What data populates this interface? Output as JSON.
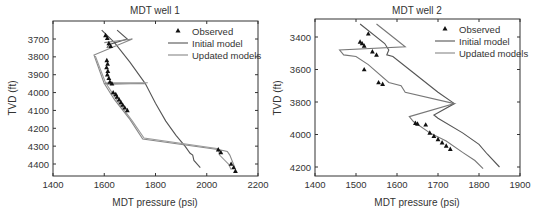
{
  "chart_data": [
    {
      "type": "line",
      "title": "MDT well 1",
      "xlabel": "MDT pressure (psi)",
      "ylabel": "TVD (ft)",
      "xlim": [
        1400,
        2200
      ],
      "ylim": [
        3620,
        4460
      ],
      "y_inverted": true,
      "xticks": [
        1400,
        1600,
        1800,
        2000,
        2200
      ],
      "yticks": [
        3700,
        3800,
        3900,
        4000,
        4100,
        4200,
        4300,
        4400
      ],
      "grid": false,
      "legend": {
        "position": "upper right",
        "entries": [
          "Observed",
          "Initial model",
          "Updated models"
        ]
      },
      "series": [
        {
          "name": "Observed",
          "kind": "scatter",
          "marker": "triangle",
          "points": [
            [
              1605,
              3680
            ],
            [
              1612,
              3695
            ],
            [
              1618,
              3725
            ],
            [
              1625,
              3740
            ],
            [
              1610,
              3820
            ],
            [
              1613,
              3840
            ],
            [
              1609,
              3860
            ],
            [
              1614,
              3880
            ],
            [
              1612,
              3900
            ],
            [
              1618,
              3920
            ],
            [
              1622,
              3940
            ],
            [
              1630,
              3950
            ],
            [
              1635,
              4000
            ],
            [
              1645,
              4010
            ],
            [
              1650,
              4025
            ],
            [
              1658,
              4040
            ],
            [
              1665,
              4055
            ],
            [
              1672,
              4070
            ],
            [
              1680,
              4085
            ],
            [
              1690,
              4100
            ],
            [
              2045,
              4320
            ],
            [
              2055,
              4335
            ],
            [
              2095,
              4400
            ],
            [
              2105,
              4420
            ],
            [
              2112,
              4440
            ]
          ]
        },
        {
          "name": "Initial model",
          "kind": "line",
          "color": "#555555",
          "points": [
            [
              1590,
              3650
            ],
            [
              1640,
              3720
            ],
            [
              1700,
              3830
            ],
            [
              1760,
              3950
            ],
            [
              1800,
              4060
            ],
            [
              1840,
              4160
            ],
            [
              1880,
              4240
            ],
            [
              1915,
              4300
            ],
            [
              1935,
              4340
            ],
            [
              1945,
              4350
            ],
            [
              1950,
              4380
            ],
            [
              1975,
              4420
            ]
          ]
        },
        {
          "name": "Initial model (branch)",
          "kind": "line",
          "color": "#555555",
          "points": [
            [
              1650,
              3650
            ],
            [
              1690,
              3700
            ],
            [
              1620,
              3730
            ],
            [
              1610,
              3750
            ]
          ]
        },
        {
          "name": "Updated models A",
          "kind": "line",
          "color": "#888888",
          "points": [
            [
              1600,
              3720
            ],
            [
              1710,
              3700
            ],
            [
              1560,
              3790
            ],
            [
              1600,
              3950
            ],
            [
              1760,
              3950
            ],
            [
              1600,
              3950
            ],
            [
              1640,
              4040
            ],
            [
              1700,
              4150
            ],
            [
              1750,
              4260
            ],
            [
              2050,
              4320
            ],
            [
              2080,
              4330
            ],
            [
              2090,
              4350
            ],
            [
              2110,
              4420
            ]
          ]
        },
        {
          "name": "Updated models B",
          "kind": "line",
          "color": "#999999",
          "points": [
            [
              1565,
              3795
            ],
            [
              1605,
              3945
            ],
            [
              1770,
              3945
            ],
            [
              1610,
              3955
            ],
            [
              1650,
              4045
            ],
            [
              1710,
              4160
            ],
            [
              1755,
              4255
            ],
            [
              2045,
              4315
            ],
            [
              2050,
              4350
            ],
            [
              2085,
              4400
            ],
            [
              2095,
              4430
            ]
          ]
        }
      ]
    },
    {
      "type": "line",
      "title": "MDT well 2",
      "xlabel": "MDT pressure (psi)",
      "ylabel": "TVD (ft)",
      "xlim": [
        1400,
        1900
      ],
      "ylim": [
        3290,
        4260
      ],
      "y_inverted": true,
      "xticks": [
        1400,
        1500,
        1600,
        1700,
        1800,
        1900
      ],
      "yticks": [
        3400,
        3600,
        3800,
        4000,
        4200
      ],
      "grid": false,
      "legend": {
        "position": "upper right",
        "entries": [
          "Observed",
          "Initial model",
          "Updated models"
        ]
      },
      "series": [
        {
          "name": "Observed",
          "kind": "scatter",
          "marker": "triangle",
          "points": [
            [
              1530,
              3380
            ],
            [
              1510,
              3430
            ],
            [
              1515,
              3440
            ],
            [
              1520,
              3455
            ],
            [
              1540,
              3490
            ],
            [
              1550,
              3510
            ],
            [
              1520,
              3600
            ],
            [
              1555,
              3680
            ],
            [
              1565,
              3690
            ],
            [
              1645,
              3930
            ],
            [
              1650,
              3935
            ],
            [
              1670,
              3940
            ],
            [
              1680,
              3990
            ],
            [
              1690,
              4010
            ],
            [
              1700,
              4030
            ],
            [
              1710,
              4050
            ],
            [
              1720,
              4070
            ],
            [
              1730,
              4090
            ]
          ]
        },
        {
          "name": "Initial model",
          "kind": "line",
          "color": "#555555",
          "points": [
            [
              1510,
              3320
            ],
            [
              1570,
              3440
            ],
            [
              1580,
              3480
            ],
            [
              1575,
              3510
            ],
            [
              1590,
              3520
            ],
            [
              1640,
              3620
            ],
            [
              1700,
              3740
            ],
            [
              1740,
              3810
            ],
            [
              1690,
              3880
            ],
            [
              1700,
              3900
            ],
            [
              1760,
              3990
            ],
            [
              1800,
              4060
            ],
            [
              1820,
              4120
            ],
            [
              1850,
              4200
            ]
          ]
        },
        {
          "name": "Updated models",
          "kind": "line",
          "color": "#777777",
          "points": [
            [
              1550,
              3320
            ],
            [
              1600,
              3420
            ],
            [
              1620,
              3460
            ],
            [
              1460,
              3480
            ],
            [
              1470,
              3510
            ],
            [
              1500,
              3520
            ],
            [
              1530,
              3570
            ],
            [
              1580,
              3680
            ],
            [
              1610,
              3700
            ],
            [
              1620,
              3740
            ],
            [
              1740,
              3810
            ],
            [
              1630,
              3890
            ],
            [
              1640,
              3920
            ],
            [
              1680,
              3990
            ],
            [
              1720,
              4040
            ],
            [
              1760,
              4110
            ],
            [
              1790,
              4160
            ],
            [
              1810,
              4210
            ]
          ]
        }
      ]
    }
  ]
}
